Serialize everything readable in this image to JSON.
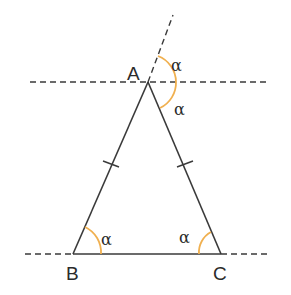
{
  "diagram": {
    "vertices": {
      "A": {
        "label": "A"
      },
      "B": {
        "label": "B"
      },
      "C": {
        "label": "C"
      }
    },
    "angle_label": "α",
    "angles": [
      {
        "at": "A",
        "position": "exterior-upper",
        "label": "α"
      },
      {
        "at": "A",
        "position": "between-parallel-and-AC",
        "label": "α"
      },
      {
        "at": "B",
        "position": "interior",
        "label": "α"
      },
      {
        "at": "C",
        "position": "interior",
        "label": "α"
      }
    ],
    "equal_sides": [
      "AB",
      "AC"
    ],
    "colors": {
      "line": "#3a3a3a",
      "angle_arc": "#f0b050"
    }
  }
}
